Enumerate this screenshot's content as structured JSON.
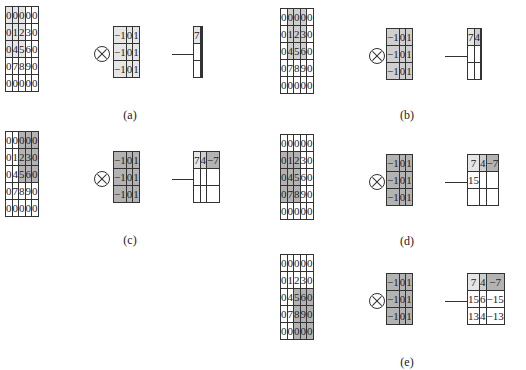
{
  "input_matrix": [
    [
      "0",
      "0",
      "0",
      "0",
      "0"
    ],
    [
      "0",
      "1",
      "2",
      "3",
      "0"
    ],
    [
      "0",
      "4",
      "5",
      "6",
      "0"
    ],
    [
      "0",
      "7",
      "8",
      "9",
      "0"
    ],
    [
      "0",
      "0",
      "0",
      "0",
      "0"
    ]
  ],
  "kernel": [
    [
      "-1",
      "0",
      "1"
    ],
    [
      "-1",
      "0",
      "1"
    ],
    [
      "-1",
      "0",
      "1"
    ]
  ],
  "operator_icon": "circled-times",
  "arrow_icon": "right-arrow",
  "colors": {
    "white": "#ffffff",
    "light": "#e6e6e6",
    "mid": "#cfcfcf",
    "dark": "#b3b3b3",
    "border": "#333333"
  },
  "panels": [
    {
      "label": "(a)",
      "input_highlight": "rows 0-2, cols 0-2 light",
      "kernel_shade": "light",
      "output": [
        [
          "7",
          "",
          ""
        ],
        [
          "",
          "",
          ""
        ],
        [
          "",
          "",
          ""
        ]
      ]
    },
    {
      "label": "(b)",
      "input_highlight": "rows 0-2, cols 1-3 mid",
      "kernel_shade": "mid",
      "output": [
        [
          "7",
          "4",
          ""
        ],
        [
          "",
          "",
          ""
        ],
        [
          "",
          "",
          ""
        ]
      ]
    },
    {
      "label": "(c)",
      "input_highlight": "rows 0-2, cols 2-4 dark",
      "kernel_shade": "dark",
      "output": [
        [
          "7",
          "4",
          "−7"
        ],
        [
          "",
          "",
          ""
        ],
        [
          "",
          "",
          ""
        ]
      ]
    },
    {
      "label": "(d)",
      "input_highlight": "rows 1-3, cols 0-2 dark",
      "kernel_shade": "dark",
      "output": [
        [
          "7",
          "4",
          "−7"
        ],
        [
          "15",
          "",
          ""
        ],
        [
          "",
          "",
          ""
        ]
      ]
    },
    {
      "label": "(e)",
      "input_highlight": "rows 2-4, cols 2-4 dark",
      "kernel_shade": "dark",
      "output": [
        [
          "7",
          "4",
          "−7"
        ],
        [
          "15",
          "6",
          "−15"
        ],
        [
          "13",
          "4",
          "−13"
        ]
      ]
    }
  ],
  "kernel_text": [
    [
      "−1",
      "0",
      "1"
    ],
    [
      "−1",
      "0",
      "1"
    ],
    [
      "−1",
      "0",
      "1"
    ]
  ]
}
